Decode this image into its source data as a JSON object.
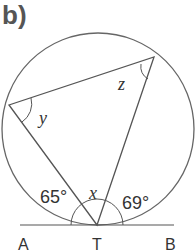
{
  "title": "b)",
  "points": {
    "A": "A",
    "T": "T",
    "B": "B"
  },
  "angles": {
    "y": "y",
    "z": "z",
    "x": "x",
    "left": "65°",
    "right": "69°"
  }
}
